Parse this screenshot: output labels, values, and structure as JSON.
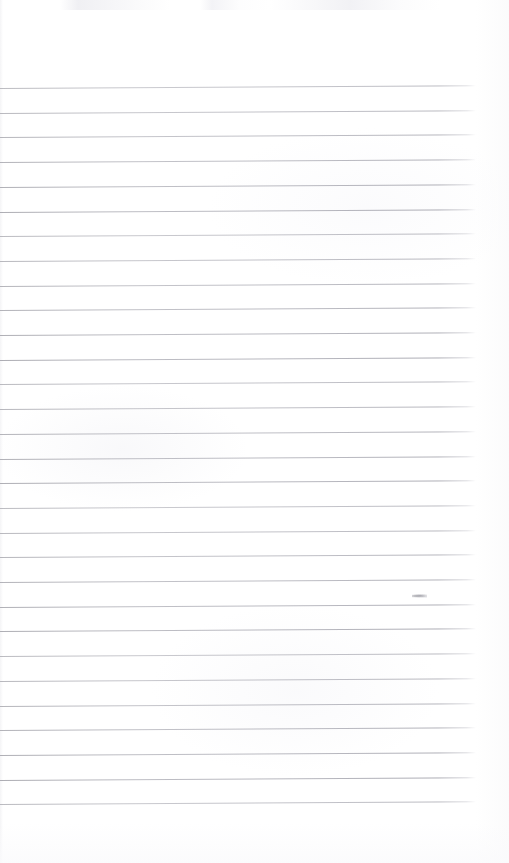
{
  "document": {
    "kind": "scanned-ruled-notebook-page",
    "title": "Blank Ruled Notebook Page",
    "page_width": 509,
    "page_height": 863,
    "background_color": "#ffffff",
    "text_content": "",
    "has_handwriting": false,
    "has_printed_text": false,
    "orientation": "portrait"
  },
  "ruling": {
    "line_color": "#9a9aa2",
    "line_thickness_px": 1,
    "line_count": 30,
    "first_line_y": 88,
    "line_spacing_px": 24.7,
    "line_start_x": 0,
    "line_end_x": 476,
    "slant_degrees": -0.32,
    "note": "Horizontal ruled lines, slightly tilted upward toward the right edge from the scan"
  },
  "margins": {
    "top_blank_height_px": 88,
    "right_blank_width_px": 33,
    "bottom_blank_height_px": 52,
    "left_blank_width_px": 0
  },
  "artifacts": [
    {
      "name": "ink-smudge",
      "x": 412,
      "y": 594,
      "width": 15,
      "height": 4,
      "color": "#78787f",
      "description": "Small faint dust or ink smudge resting on one ruled line"
    }
  ],
  "scan_noise": {
    "top_band_height_px": 10,
    "tint_color": "#f2f2f5",
    "description": "Faint grey scanner noise across the very top edge of the page"
  }
}
